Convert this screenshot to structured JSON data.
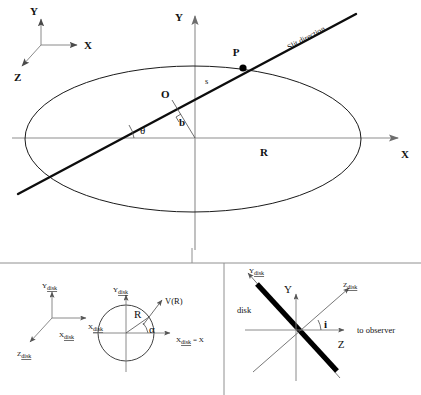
{
  "figure": {
    "caption": "",
    "background_color": "#ffffff",
    "line_color": "#111111",
    "axis_color": "#8d8d8d"
  },
  "top_panel": {
    "name": "slit-geometry-panel",
    "triad": {
      "y_label": "Y",
      "x_label": "X",
      "z_label": "Z"
    },
    "axes": {
      "y_label": "Y",
      "x_label": "X"
    },
    "labels": {
      "point_p": "P",
      "point_o": "O",
      "slit_direction": "Slit direction",
      "impact_parameter": "b",
      "arclength": "s",
      "angle_theta": "θ",
      "radius_r": "R"
    }
  },
  "bottom_left_panel": {
    "name": "disk-face-on-panel",
    "triad": {
      "y_label": "Y",
      "y_sub": "disk",
      "x_label": "X",
      "x_sub": "disk",
      "z_label": "Z",
      "z_sub": "disk"
    },
    "axes": {
      "y_label": "Y",
      "y_sub": "disk",
      "x_left_label": "X",
      "x_left_sub": "disk",
      "x_right_label": "X",
      "x_right_sub": "disk",
      "x_right_suffix": "= X"
    },
    "labels": {
      "velocity": "V(R)",
      "radius": "R",
      "angle_alpha": "α"
    }
  },
  "bottom_right_panel": {
    "name": "disk-edge-on-panel",
    "axes": {
      "y_disk_label": "Y",
      "y_disk_sub": "disk",
      "z_disk_label": "Z",
      "z_disk_sub": "disk",
      "y_label": "Y",
      "z_label": "Z"
    },
    "labels": {
      "disk": "disk",
      "inclination": "i",
      "observer": "to observer"
    }
  }
}
